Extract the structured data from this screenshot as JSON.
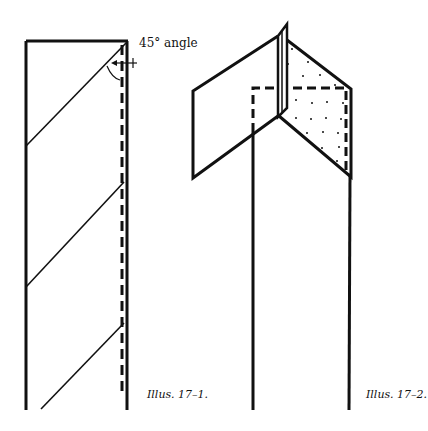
{
  "figures": [
    {
      "id": "illus-17-1",
      "caption": "Illus. 17–1.",
      "annotation": "45° angle"
    },
    {
      "id": "illus-17-2",
      "caption": "Illus. 17–2."
    }
  ],
  "colors": {
    "line": "#111111",
    "background": "#ffffff"
  }
}
